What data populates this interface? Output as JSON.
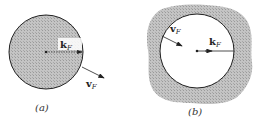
{
  "figure": {
    "panels": [
      {
        "id": "a",
        "caption": "(a)",
        "description": "Filled (occupied) Fermi sphere with shaded interior",
        "labels": {
          "k": "k",
          "k_sub": "F",
          "v": "v",
          "v_sub": "F"
        },
        "circle": {
          "cx": 46,
          "cy": 52,
          "r": 37,
          "fill": "shaded"
        }
      },
      {
        "id": "b",
        "caption": "(b)",
        "description": "Empty Fermi sphere surrounded by shaded (occupied) region",
        "labels": {
          "k": "k",
          "k_sub": "F",
          "v": "v",
          "v_sub": "F"
        },
        "circle": {
          "cx": 197,
          "cy": 51,
          "r": 37,
          "fill": "empty"
        }
      }
    ],
    "colors": {
      "shade": "#b8b8b8",
      "line": "#222222",
      "background": "#ffffff"
    }
  }
}
